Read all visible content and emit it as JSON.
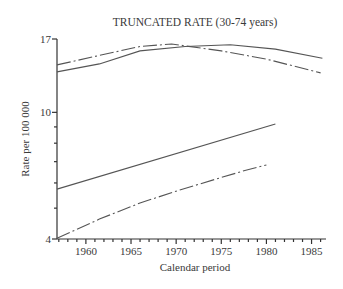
{
  "chart_data": {
    "type": "line",
    "title": "TRUNCATED RATE (30-74 years)",
    "xlabel": "Calendar period",
    "ylabel": "Rate per 100 000",
    "yscale": "log",
    "ylim": [
      4,
      17
    ],
    "xlim": [
      1956.8,
      1986.6
    ],
    "yticks_labeled": [
      4,
      10,
      17
    ],
    "yticks_minor": [
      5,
      6,
      7,
      8,
      9
    ],
    "xticks_labeled": [
      1960,
      1965,
      1970,
      1975,
      1980,
      1985
    ],
    "xticks_minor_step": 1,
    "grid": false,
    "legend": null,
    "series": [
      {
        "name": "upper-solid",
        "style": "solid",
        "x": [
          1956.8,
          1961.5,
          1966,
          1971,
          1976,
          1981,
          1986.2
        ],
        "values": [
          13.4,
          14.2,
          15.6,
          16.1,
          16.3,
          15.8,
          14.8
        ]
      },
      {
        "name": "upper-dashdot",
        "style": "dashdot",
        "x": [
          1956.8,
          1961.5,
          1966,
          1969.5,
          1975,
          1980,
          1986
        ],
        "values": [
          14.1,
          15.1,
          16.1,
          16.4,
          15.6,
          14.7,
          13.3
        ]
      },
      {
        "name": "lower-solid",
        "style": "solid",
        "x": [
          1956.8,
          1981
        ],
        "values": [
          5.74,
          9.19
        ]
      },
      {
        "name": "lower-dashdot",
        "style": "dashdot",
        "x": [
          1956.8,
          1961.5,
          1966,
          1970.4,
          1974.8,
          1977.5,
          1980
        ],
        "values": [
          4.02,
          4.62,
          5.19,
          5.7,
          6.22,
          6.55,
          6.83
        ]
      }
    ]
  }
}
